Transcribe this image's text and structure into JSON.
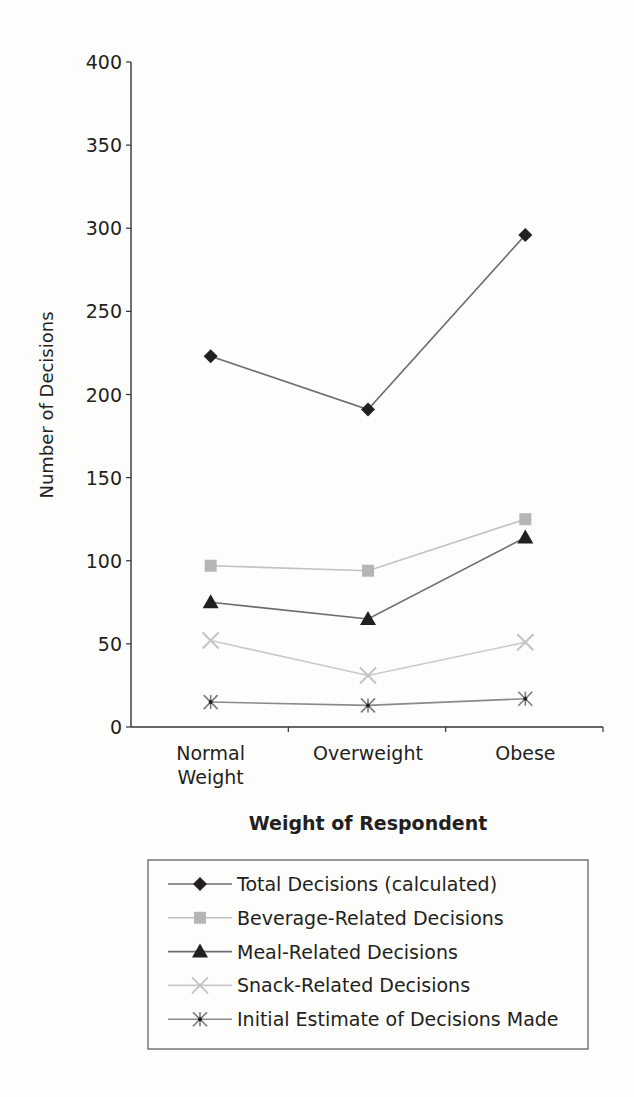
{
  "chart_data": {
    "type": "line",
    "title": "",
    "xlabel": "Weight of Respondent",
    "ylabel": "Number of Decisions",
    "ylim": [
      0,
      400
    ],
    "yticks": [
      0,
      50,
      100,
      150,
      200,
      250,
      300,
      350,
      400
    ],
    "grid": false,
    "legend_position": "bottom",
    "categories": [
      [
        "Normal",
        "Weight"
      ],
      [
        "Overweight"
      ],
      [
        "Obese"
      ]
    ],
    "category_names": [
      "Normal Weight",
      "Overweight",
      "Obese"
    ],
    "series": [
      {
        "name": "Total Decisions (calculated)",
        "marker": "diamond",
        "color": "#231f20",
        "line_color": "#6d6d6d",
        "values": [
          223,
          191,
          296
        ]
      },
      {
        "name": "Beverage-Related Decisions",
        "marker": "square",
        "color": "#b5b5b5",
        "line_color": "#c2c2c2",
        "values": [
          97,
          94,
          125
        ]
      },
      {
        "name": "Meal-Related Decisions",
        "marker": "triangle",
        "color": "#231f20",
        "line_color": "#6d6d6d",
        "values": [
          75,
          65,
          114
        ]
      },
      {
        "name": "Snack-Related Decisions",
        "marker": "x",
        "color": "#c4c4c4",
        "line_color": "#cacaca",
        "values": [
          52,
          31,
          51
        ]
      },
      {
        "name": "Initial Estimate of Decisions Made",
        "marker": "asterisk",
        "color": "#7a7a7a",
        "line_color": "#8a8a8a",
        "values": [
          15,
          13,
          17
        ]
      }
    ]
  }
}
